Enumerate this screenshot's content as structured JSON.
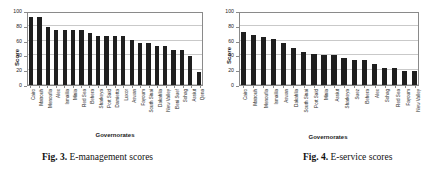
{
  "figures": [
    {
      "caption_label": "Fig. 3.",
      "caption_text": "E-management scores",
      "chart_data": {
        "type": "bar",
        "title": "",
        "xlabel": "Governorates",
        "ylabel": "Score",
        "ylim": [
          0,
          100
        ],
        "yticks": [
          0,
          20,
          40,
          60,
          80,
          100
        ],
        "grid": true,
        "legend": "none",
        "categories": [
          "Cairo",
          "Matrouh",
          "Menoufia",
          "Alex",
          "Ismailia",
          "Minia",
          "Red Sea",
          "Behera",
          "Sharkeya",
          "Port Said",
          "Damietta",
          "Luxor",
          "Aswan",
          "Fayoum",
          "South Sinai",
          "Dakahlia",
          "New Valley",
          "Beni Suef",
          "Sohag",
          "Assiut",
          "Qena"
        ],
        "values": [
          95,
          95,
          81,
          77,
          77,
          77,
          77,
          72,
          68,
          68,
          68,
          68,
          63,
          59,
          59,
          54,
          54,
          49,
          49,
          40,
          18
        ]
      }
    },
    {
      "caption_label": "Fig. 4.",
      "caption_text": "E-service scores",
      "chart_data": {
        "type": "bar",
        "title": "",
        "xlabel": "Governorates",
        "ylabel": "Score",
        "ylim": [
          0,
          100
        ],
        "yticks": [
          0,
          20,
          40,
          60,
          80,
          100
        ],
        "grid": true,
        "legend": "none",
        "categories": [
          "Cairo",
          "Matrouh",
          "Menoufia",
          "Ismailia",
          "Aswan",
          "Dakahlia",
          "South Sinai",
          "Port Said",
          "Minia",
          "Assiut",
          "Sharkeya",
          "Suez",
          "Behera",
          "Alex",
          "Sohag",
          "Red Sea",
          "Fayoum",
          "New Valley"
        ],
        "values": [
          73,
          70,
          67,
          64,
          58,
          52,
          46,
          43,
          41,
          41,
          37,
          35,
          35,
          29,
          23,
          23,
          20,
          20
        ]
      }
    }
  ],
  "colors": {
    "bar": "#1f1f1f",
    "grid": "#c9c9c9",
    "axis": "#8a8a8a",
    "text": "#1a1a1a",
    "background": "#ffffff"
  }
}
